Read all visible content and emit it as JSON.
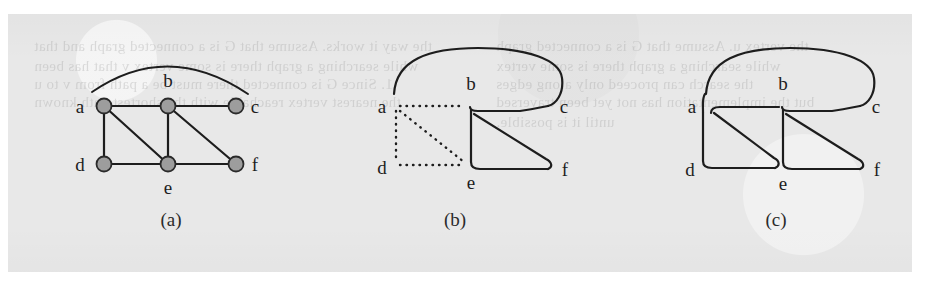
{
  "page": {
    "background_color": "#e8e8e8",
    "ink_color": "#1d1d1d",
    "node_fill_color": "#9d9d9d",
    "node_stroke_color": "#2a2a2a"
  },
  "figure": {
    "kind": "graph-traversal-illustration",
    "panels": [
      {
        "id": "a",
        "caption": "(a)",
        "style": "undirected-graph-with-filled-vertices",
        "vertices": [
          {
            "id": "a",
            "label": "a",
            "x": 96,
            "y": 92,
            "label_x": 74,
            "label_y": 99
          },
          {
            "id": "b",
            "label": "b",
            "x": 160,
            "y": 92,
            "label_x": 154,
            "label_y": 72
          },
          {
            "id": "c",
            "label": "c",
            "x": 228,
            "y": 92,
            "label_x": 243,
            "label_y": 99
          },
          {
            "id": "d",
            "label": "d",
            "x": 96,
            "y": 150,
            "label_x": 74,
            "label_y": 157
          },
          {
            "id": "e",
            "label": "e",
            "x": 160,
            "y": 150,
            "label_x": 154,
            "label_y": 178
          },
          {
            "id": "f",
            "label": "f",
            "x": 228,
            "y": 150,
            "label_x": 243,
            "label_y": 157
          }
        ],
        "edges": [
          {
            "from": "a",
            "to": "c",
            "style": "arc"
          },
          {
            "from": "a",
            "to": "b",
            "style": "straight"
          },
          {
            "from": "b",
            "to": "c",
            "style": "straight"
          },
          {
            "from": "a",
            "to": "d",
            "style": "straight"
          },
          {
            "from": "a",
            "to": "e",
            "style": "straight"
          },
          {
            "from": "b",
            "to": "e",
            "style": "straight"
          },
          {
            "from": "b",
            "to": "f",
            "style": "straight"
          },
          {
            "from": "d",
            "to": "e",
            "style": "straight"
          },
          {
            "from": "e",
            "to": "f",
            "style": "straight"
          }
        ]
      },
      {
        "id": "b",
        "caption": "(b)",
        "style": "graph-with-dotted-tree-edges-and-solid-traversal-outline",
        "vertices": [
          {
            "id": "a",
            "label": "a",
            "x": 388,
            "y": 92,
            "label_x": 368,
            "label_y": 99
          },
          {
            "id": "b",
            "label": "b",
            "x": 462,
            "y": 92,
            "label_x": 456,
            "label_y": 72
          },
          {
            "id": "c",
            "label": "c",
            "x": 540,
            "y": 92,
            "label_x": 548,
            "label_y": 99
          },
          {
            "id": "d",
            "label": "d",
            "x": 388,
            "y": 150,
            "label_x": 368,
            "label_y": 157
          },
          {
            "id": "e",
            "label": "e",
            "x": 462,
            "y": 150,
            "label_x": 456,
            "label_y": 178
          },
          {
            "id": "f",
            "label": "f",
            "x": 540,
            "y": 150,
            "label_x": 550,
            "label_y": 157
          }
        ],
        "dotted_edges": [
          {
            "from": "a",
            "to": "b"
          },
          {
            "from": "a",
            "to": "d"
          },
          {
            "from": "a",
            "to": "e"
          },
          {
            "from": "d",
            "to": "e"
          }
        ],
        "solid_path_description": "rounded outline from a over the top to c, back to b, diagonally down to f, then left to e"
      },
      {
        "id": "c",
        "caption": "(c)",
        "style": "continuous-rounded-traversal-outline",
        "vertices": [
          {
            "id": "a",
            "label": "a",
            "x": 700,
            "y": 92,
            "label_x": 678,
            "label_y": 99
          },
          {
            "id": "b",
            "label": "b",
            "x": 774,
            "y": 92,
            "label_x": 768,
            "label_y": 72
          },
          {
            "id": "c",
            "label": "c",
            "x": 852,
            "y": 92,
            "label_x": 860,
            "label_y": 99
          },
          {
            "id": "d",
            "label": "d",
            "x": 700,
            "y": 150,
            "label_x": 678,
            "label_y": 157
          },
          {
            "id": "e",
            "label": "e",
            "x": 774,
            "y": 150,
            "label_x": 768,
            "label_y": 178
          },
          {
            "id": "f",
            "label": "f",
            "x": 852,
            "y": 150,
            "label_x": 862,
            "label_y": 157
          }
        ],
        "solid_path_description": "single closed rounded outline tracing a-b-c back to b, b-f, f-e, e-d, d-a with a diagonal inside each half"
      }
    ]
  },
  "show_through_text": {
    "lines": [
      {
        "text": "the way it works. Assume that G is a connected graph and that",
        "x": 26,
        "y": 24,
        "size": 15
      },
      {
        "text": "while searching a graph there is some vertex v that has been",
        "x": 26,
        "y": 44,
        "size": 15
      },
      {
        "text": "1. Since G is connected there must be a path from v to u",
        "x": 26,
        "y": 62,
        "size": 15
      },
      {
        "text": "the nearest vertex reachable with the shortest path known",
        "x": 26,
        "y": 80,
        "size": 15
      },
      {
        "text": "the vertex u. Assume that G is a connected graph",
        "x": 488,
        "y": 24,
        "size": 15
      },
      {
        "text": "while searching a graph there is some vertex",
        "x": 488,
        "y": 44,
        "size": 15
      },
      {
        "text": "the search can proceed only along edges",
        "x": 488,
        "y": 62,
        "size": 15
      },
      {
        "text": "but the implementation has not yet been traversed",
        "x": 488,
        "y": 80,
        "size": 15
      },
      {
        "text": "until it is possible.",
        "x": 488,
        "y": 100,
        "size": 15
      }
    ]
  }
}
